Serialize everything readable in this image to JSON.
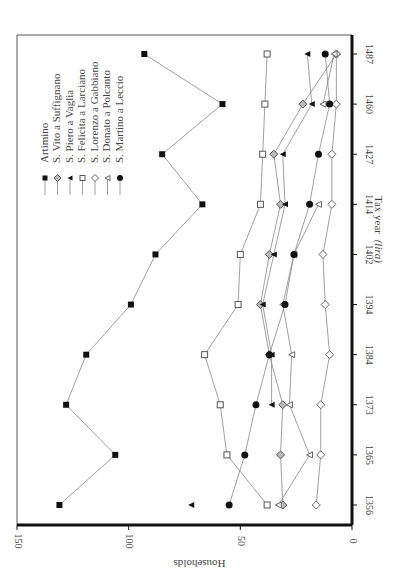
{
  "chart_data": {
    "type": "line",
    "title": "",
    "orientation": "rotated-90",
    "xlabel": "Tax year",
    "xlabel_italic_suffix": "(lira)",
    "ylabel": "Households",
    "ylim": [
      0,
      150
    ],
    "yticks": [
      0,
      50,
      100,
      150
    ],
    "ytick_labels": [
      "0",
      "50",
      "100",
      "150"
    ],
    "categories": [
      "1356",
      "1365",
      "1373",
      "1384",
      "1394",
      "1402",
      "1414",
      "1427",
      "1460",
      "1487"
    ],
    "grid": false,
    "legend_position": "top-left",
    "caption_partial": "Figure ... Population ... (households)",
    "series": [
      {
        "name": "Artimino",
        "marker": "filled-square",
        "values": [
          131,
          106,
          128,
          119,
          99,
          88,
          67,
          85,
          58,
          93
        ]
      },
      {
        "name": "S. Vito a Suffignano",
        "marker": "gray-diamond",
        "values": [
          31,
          32,
          31,
          37,
          41,
          37,
          32,
          35,
          22,
          7
        ]
      },
      {
        "name": "S. Piero a Vaglia",
        "marker": "filled-triangle",
        "values": [
          72,
          null,
          36,
          36,
          40,
          35,
          30,
          31,
          18,
          20
        ]
      },
      {
        "name": "S. Felicita a Larciano",
        "marker": "open-square",
        "values": [
          38,
          56,
          59,
          66,
          51,
          50,
          41,
          40,
          39,
          38
        ]
      },
      {
        "name": "S. Lorenzo a Gabbiano",
        "marker": "open-diamond",
        "values": [
          16,
          14,
          14,
          10,
          12,
          13,
          9,
          9,
          7,
          7
        ]
      },
      {
        "name": "S. Donato a Polcanto",
        "marker": "open-triangle",
        "values": [
          33,
          19,
          28,
          27,
          31,
          26,
          15,
          null,
          13,
          8
        ]
      },
      {
        "name": "S. Martino a Leccio",
        "marker": "filled-circle",
        "values": [
          55,
          48,
          43,
          37,
          30,
          26,
          19,
          15,
          10,
          12
        ]
      }
    ]
  }
}
